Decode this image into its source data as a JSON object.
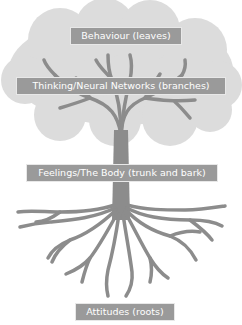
{
  "colors": {
    "crown": "#dcdcdc",
    "tree": "#8c8c8c",
    "label_bg": "#9a9a9a",
    "label_text": "#ffffff"
  },
  "labels": {
    "leaves": "Behaviour (leaves)",
    "branches": "Thinking/Neural Networks (branches)",
    "trunk": "Feelings/The Body (trunk and bark)",
    "roots": "Attitudes (roots)"
  }
}
